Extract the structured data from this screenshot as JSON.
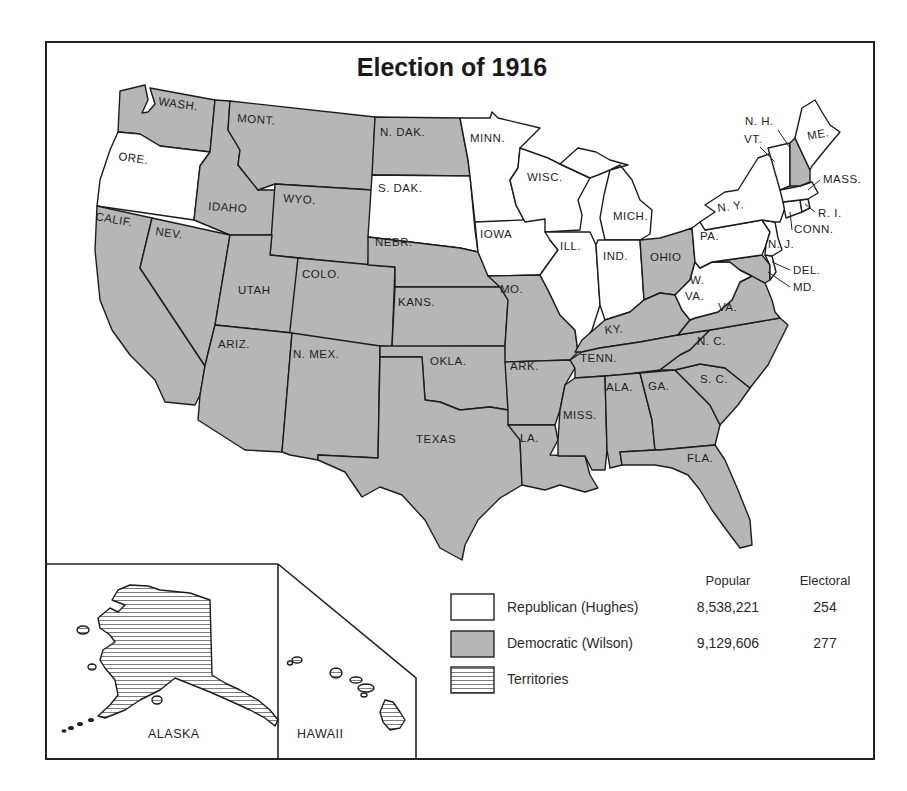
{
  "map": {
    "title": "Election of 1916",
    "colors": {
      "democratic": "#b6b6b6",
      "republican": "#ffffff",
      "outline": "#1c1c1c"
    },
    "states": {
      "wash": {
        "label": "WASH.",
        "party": "Democratic"
      },
      "ore": {
        "label": "ORE.",
        "party": "Republican"
      },
      "calif": {
        "label": "CALIF.",
        "party": "Democratic"
      },
      "nev": {
        "label": "NEV.",
        "party": "Democratic"
      },
      "idaho": {
        "label": "IDAHO",
        "party": "Democratic"
      },
      "mont": {
        "label": "MONT.",
        "party": "Democratic"
      },
      "wyo": {
        "label": "WYO.",
        "party": "Democratic"
      },
      "utah": {
        "label": "UTAH",
        "party": "Democratic"
      },
      "colo": {
        "label": "COLO.",
        "party": "Democratic"
      },
      "ariz": {
        "label": "ARIZ.",
        "party": "Democratic"
      },
      "nmex": {
        "label": "N. MEX.",
        "party": "Democratic"
      },
      "ndak": {
        "label": "N. DAK.",
        "party": "Democratic"
      },
      "sdak": {
        "label": "S. DAK.",
        "party": "Republican"
      },
      "nebr": {
        "label": "NEBR.",
        "party": "Democratic"
      },
      "kans": {
        "label": "KANS.",
        "party": "Democratic"
      },
      "okla": {
        "label": "OKLA.",
        "party": "Democratic"
      },
      "texas": {
        "label": "TEXAS",
        "party": "Democratic"
      },
      "minn": {
        "label": "MINN.",
        "party": "Republican"
      },
      "iowa": {
        "label": "IOWA",
        "party": "Republican"
      },
      "mo": {
        "label": "MO.",
        "party": "Democratic"
      },
      "ark": {
        "label": "ARK.",
        "party": "Democratic"
      },
      "la": {
        "label": "LA.",
        "party": "Democratic"
      },
      "wisc": {
        "label": "WISC.",
        "party": "Republican"
      },
      "ill": {
        "label": "ILL.",
        "party": "Republican"
      },
      "mich": {
        "label": "MICH.",
        "party": "Republican"
      },
      "ind": {
        "label": "IND.",
        "party": "Republican"
      },
      "ohio": {
        "label": "OHIO",
        "party": "Democratic"
      },
      "ky": {
        "label": "KY.",
        "party": "Democratic"
      },
      "tenn": {
        "label": "TENN.",
        "party": "Democratic"
      },
      "miss": {
        "label": "MISS.",
        "party": "Democratic"
      },
      "ala": {
        "label": "ALA.",
        "party": "Democratic"
      },
      "ga": {
        "label": "GA.",
        "party": "Democratic"
      },
      "fla": {
        "label": "FLA.",
        "party": "Democratic"
      },
      "sc": {
        "label": "S. C.",
        "party": "Democratic"
      },
      "nc": {
        "label": "N. C.",
        "party": "Democratic"
      },
      "va": {
        "label": "VA.",
        "party": "Democratic"
      },
      "wva": {
        "label1": "W.",
        "label2": "VA.",
        "party": "Republican"
      },
      "md": {
        "label": "MD.",
        "party": "Democratic"
      },
      "del": {
        "label": "DEL.",
        "party": "Republican"
      },
      "pa": {
        "label": "PA.",
        "party": "Republican"
      },
      "nj": {
        "label": "N. J.",
        "party": "Republican"
      },
      "ny": {
        "label": "N. Y.",
        "party": "Republican"
      },
      "conn": {
        "label": "CONN.",
        "party": "Republican"
      },
      "ri": {
        "label": "R. I.",
        "party": "Republican"
      },
      "mass": {
        "label": "MASS.",
        "party": "Republican"
      },
      "vt": {
        "label": "VT.",
        "party": "Republican"
      },
      "nh": {
        "label": "N. H.",
        "party": "Democratic"
      },
      "me": {
        "label": "ME.",
        "party": "Republican"
      }
    },
    "insets": {
      "alaska": {
        "label": "ALASKA",
        "status": "Territory"
      },
      "hawaii": {
        "label": "HAWAII",
        "status": "Territory"
      }
    }
  },
  "legend": {
    "col_popular": "Popular",
    "col_electoral": "Electoral",
    "rows": [
      {
        "key": "republican",
        "label": "Republican (Hughes)",
        "popular": "8,538,221",
        "electoral": "254"
      },
      {
        "key": "democratic",
        "label": "Democratic (Wilson)",
        "popular": "9,129,606",
        "electoral": "277"
      },
      {
        "key": "territories",
        "label": "Territories"
      }
    ]
  }
}
